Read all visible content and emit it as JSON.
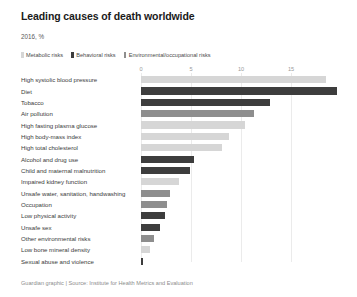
{
  "header": {
    "title": "Leading causes of death worldwide",
    "subtitle": "2016, %"
  },
  "legend": {
    "items": [
      {
        "label": "Metabolic risks",
        "key": "metabolic",
        "color": "#d6d6d6"
      },
      {
        "label": "Behavioral risks",
        "key": "behavioral",
        "color": "#3d3d3d"
      },
      {
        "label": "Environmental/occupational risks",
        "key": "environmental",
        "color": "#8e8e8e"
      }
    ]
  },
  "footer": {
    "credit": "Guardian graphic | Source: Institute for Health Metrics and Evaluation"
  },
  "colors": {
    "metabolic": "#d6d6d6",
    "behavioral": "#3d3d3d",
    "environmental": "#8e8e8e",
    "gridline": "#ebebeb",
    "title": "#1a1a1a",
    "label": "#3b3b3b",
    "tick": "#9a9a9a"
  },
  "chart_data": {
    "type": "bar",
    "orientation": "horizontal",
    "title": "Leading causes of death worldwide",
    "subtitle": "2016, %",
    "xlabel": "",
    "ylabel": "",
    "xlim": [
      0,
      20
    ],
    "xticks": [
      0,
      5,
      10,
      15
    ],
    "xtick_labels": [
      "0",
      "5",
      "10",
      "15"
    ],
    "grid": true,
    "legend_position": "top",
    "categories": [
      "High systolic blood pressure",
      "Diet",
      "Tobacco",
      "Air pollution",
      "High fasting plasma glucose",
      "High body-mass index",
      "High total cholesterol",
      "Alcohol and drug use",
      "Child and maternal malnutrition",
      "Impaired kidney function",
      "Unsafe water, sanitation, handwashing",
      "Occupation",
      "Low physical activity",
      "Unsafe sex",
      "Other environmental risks",
      "Low bone mineral density",
      "Sexual abuse and violence"
    ],
    "values": [
      18.5,
      19.6,
      12.9,
      11.3,
      10.4,
      8.8,
      8.1,
      5.3,
      4.9,
      3.8,
      2.9,
      2.6,
      2.4,
      1.9,
      1.3,
      0.9,
      0.2
    ],
    "groups": [
      "metabolic",
      "behavioral",
      "behavioral",
      "environmental",
      "metabolic",
      "metabolic",
      "metabolic",
      "behavioral",
      "behavioral",
      "metabolic",
      "environmental",
      "environmental",
      "behavioral",
      "behavioral",
      "environmental",
      "metabolic",
      "behavioral"
    ],
    "bars": [
      {
        "label": "High systolic blood pressure",
        "value": 18.5,
        "group": "metabolic"
      },
      {
        "label": "Diet",
        "value": 19.6,
        "group": "behavioral"
      },
      {
        "label": "Tobacco",
        "value": 12.9,
        "group": "behavioral"
      },
      {
        "label": "Air pollution",
        "value": 11.3,
        "group": "environmental"
      },
      {
        "label": "High fasting plasma glucose",
        "value": 10.4,
        "group": "metabolic"
      },
      {
        "label": "High body-mass index",
        "value": 8.8,
        "group": "metabolic"
      },
      {
        "label": "High total cholesterol",
        "value": 8.1,
        "group": "metabolic"
      },
      {
        "label": "Alcohol and drug use",
        "value": 5.3,
        "group": "behavioral"
      },
      {
        "label": "Child and maternal malnutrition",
        "value": 4.9,
        "group": "behavioral"
      },
      {
        "label": "Impaired kidney function",
        "value": 3.8,
        "group": "metabolic"
      },
      {
        "label": "Unsafe water, sanitation, handwashing",
        "value": 2.9,
        "group": "environmental"
      },
      {
        "label": "Occupation",
        "value": 2.6,
        "group": "environmental"
      },
      {
        "label": "Low physical activity",
        "value": 2.4,
        "group": "behavioral"
      },
      {
        "label": "Unsafe sex",
        "value": 1.9,
        "group": "behavioral"
      },
      {
        "label": "Other environmental risks",
        "value": 1.3,
        "group": "environmental"
      },
      {
        "label": "Low bone mineral density",
        "value": 0.9,
        "group": "metabolic"
      },
      {
        "label": "Sexual abuse and violence",
        "value": 0.2,
        "group": "behavioral"
      }
    ]
  }
}
